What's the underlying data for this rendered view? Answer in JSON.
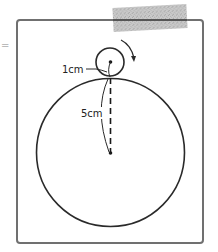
{
  "figure": {
    "type": "geometry-diagram",
    "labels": {
      "small_radius": "1cm",
      "large_radius": "5cm"
    },
    "edge_mark": "="
  },
  "shapes": {
    "frame": {
      "x": 17,
      "y": 20,
      "width": 186,
      "height": 223,
      "rx": 3
    },
    "small_circle": {
      "cx": 110,
      "cy": 62,
      "r": 14,
      "radius_cm": 1
    },
    "large_circle": {
      "cx": 110.5,
      "cy": 152.5,
      "r": 73,
      "radius_cm": 5
    },
    "rotation_arrow": {
      "direction": "clockwise"
    },
    "tape": {
      "x": 113,
      "y": 6,
      "width": 74,
      "height": 24,
      "rotate": -3
    }
  },
  "colors": {
    "stroke": "#2a2a2a",
    "frame": "#707070",
    "tape": "#b8b8b8",
    "background": "#ffffff"
  }
}
